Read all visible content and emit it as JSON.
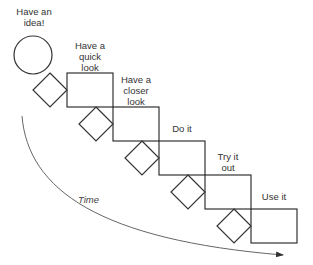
{
  "diagram": {
    "type": "staircase-process",
    "colors": {
      "stroke": "#333333",
      "arrow": "#666666",
      "text": "#333333"
    },
    "start": {
      "shape": "circle",
      "label": "Have an\nidea!"
    },
    "steps": [
      {
        "label": "Have a\nquick\nlook"
      },
      {
        "label": "Have a\ncloser\nlook"
      },
      {
        "label": "Do it"
      },
      {
        "label": "Try it\nout"
      },
      {
        "label": "Use it"
      }
    ],
    "connectors": {
      "shape": "diamond",
      "count": 5
    },
    "time_arrow": {
      "label": "Time"
    }
  }
}
